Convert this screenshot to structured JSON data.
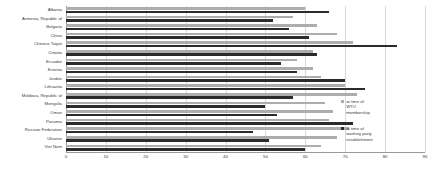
{
  "chart_data": {
    "type": "bar",
    "orientation": "horizontal",
    "title": "",
    "subtitle": "",
    "xlabel": "",
    "ylabel": "",
    "xlim": [
      0,
      90
    ],
    "ylim": null,
    "grid": true,
    "grid_axis": "x",
    "legend_position": "right",
    "categories": [
      "Albania",
      "Armenia, Republic of",
      "Bulgaria",
      "China",
      "Chinese Taipei",
      "Croatia",
      "Ecuador",
      "Estonia",
      "Jordan",
      "Lithuania",
      "Moldova, Republic of",
      "Mongolia",
      "Oman",
      "Panama",
      "Russian Federation",
      "Ukraine",
      "Viet Nam"
    ],
    "xticks": [
      0,
      10,
      20,
      30,
      40,
      50,
      60,
      70,
      80,
      90
    ],
    "xticklabels": [
      "0",
      "10",
      "20",
      "30",
      "40",
      "50",
      "60",
      "70",
      "80",
      "90"
    ],
    "series": [
      {
        "name": "at time of WTO membership",
        "color": "#adadad",
        "values": [
          60,
          57,
          63,
          68,
          72,
          62,
          58,
          62,
          64,
          70,
          73,
          65,
          67,
          66,
          71,
          68,
          64
        ]
      },
      {
        "name": "at time of working party establishment",
        "color": "#2b2b2b",
        "values": [
          66,
          52,
          56,
          61,
          83,
          63,
          54,
          58,
          70,
          75,
          57,
          50,
          53,
          72,
          47,
          51,
          60
        ]
      }
    ]
  },
  "legend": {
    "items": [
      {
        "label": "at time of WTO membership",
        "color": "#adadad"
      },
      {
        "label": "at time of working party establishment",
        "color": "#2b2b2b"
      }
    ]
  },
  "colors": {
    "membership": "#adadad",
    "working_party": "#2b2b2b",
    "grid": "#d9d9d9",
    "axis": "#9a9a9a",
    "text": "#3d3d3d",
    "background": "#ffffff"
  }
}
